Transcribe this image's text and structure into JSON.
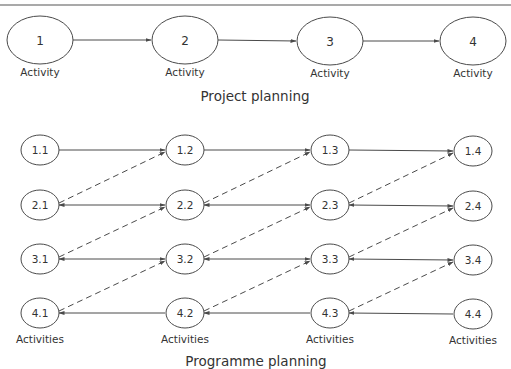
{
  "colors": {
    "stroke": "#4a4a4a",
    "text": "#333333",
    "background": "#ffffff"
  },
  "project": {
    "title": "Project planning",
    "nodes": [
      {
        "id": "1",
        "label": "Activity"
      },
      {
        "id": "2",
        "label": "Activity"
      },
      {
        "id": "3",
        "label": "Activity"
      },
      {
        "id": "4",
        "label": "Activity"
      }
    ],
    "edges": [
      {
        "from": "1",
        "to": "2",
        "style": "solid"
      },
      {
        "from": "2",
        "to": "3",
        "style": "solid"
      },
      {
        "from": "3",
        "to": "4",
        "style": "solid"
      }
    ]
  },
  "programme": {
    "title": "Programme planning",
    "column_label": "Activities",
    "rows": [
      [
        "1.1",
        "1.2",
        "1.3",
        "1.4"
      ],
      [
        "2.1",
        "2.2",
        "2.3",
        "2.4"
      ],
      [
        "3.1",
        "3.2",
        "3.3",
        "3.4"
      ],
      [
        "4.1",
        "4.2",
        "4.3",
        "4.4"
      ]
    ],
    "solid_edges": "each node connects to the next node in its row (left to right)",
    "dashed_edges": "each node (r+1,c) connects diagonally to node (r,c+1)"
  }
}
